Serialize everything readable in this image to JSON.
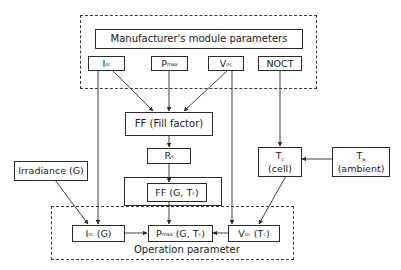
{
  "diagram": {
    "groups": {
      "manufacturer": {
        "title": "Manufacturer's module parameters"
      },
      "operation": {
        "title": "Operation parameter"
      }
    },
    "nodes": {
      "isc": {
        "main": "I",
        "sub": "sc"
      },
      "pmax": {
        "main": "P",
        "sub": "max"
      },
      "voc": {
        "main": "V",
        "sub": "oc"
      },
      "noct": {
        "main": "NOCT"
      },
      "ff": {
        "main": "FF (Fill factor)"
      },
      "rs": {
        "main": "R",
        "sub": "s"
      },
      "ff_gtc": {
        "main": "FF (G, T",
        "sub": "c",
        "tail": ")"
      },
      "irradiance": {
        "main": "Irradiance (G)"
      },
      "tc": {
        "main": "T",
        "sub": "c",
        "line2": "(cell)"
      },
      "ta": {
        "main": "T",
        "sub": "a",
        "line2": "(ambient)"
      },
      "isc_g": {
        "main": "I",
        "sub": "sc",
        "tail": " (G)"
      },
      "pmax_gtc": {
        "main": "P",
        "sub": "max",
        "tail": " (G, T",
        "sub2": "c",
        "tail2": ")"
      },
      "voc_tc": {
        "main": "V",
        "sub": "oc",
        "tail": " (T",
        "sub2": "c",
        "tail2": ")"
      }
    },
    "edges": [
      {
        "from": "isc",
        "to": "ff"
      },
      {
        "from": "pmax",
        "to": "ff"
      },
      {
        "from": "voc",
        "to": "ff"
      },
      {
        "from": "ff",
        "to": "rs"
      },
      {
        "from": "rs",
        "to": "ff_gtc"
      },
      {
        "from": "ff_gtc",
        "to": "pmax_gtc"
      },
      {
        "from": "isc",
        "to": "isc_g"
      },
      {
        "from": "voc",
        "to": "voc_tc"
      },
      {
        "from": "noct",
        "to": "tc"
      },
      {
        "from": "ta",
        "to": "tc"
      },
      {
        "from": "tc",
        "to": "voc_tc"
      },
      {
        "from": "irradiance",
        "to": "isc_g"
      },
      {
        "from": "isc_g",
        "to": "pmax_gtc"
      },
      {
        "from": "voc_tc",
        "to": "pmax_gtc"
      }
    ],
    "colors": {
      "line": "#2a2a2a",
      "background": "#ffffff"
    }
  }
}
